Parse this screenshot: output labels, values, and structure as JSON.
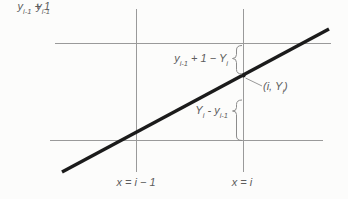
{
  "figure": {
    "background": "#fcfcfb",
    "colors": {
      "guide_line": "#9a9a9a",
      "main_line": "#1b1b1b",
      "annotation": "#8c8c8c",
      "text": "#5d5d5d"
    },
    "labels": {
      "y_top": {
        "p1": "y",
        "s1": "i-1",
        "p2": " + 1"
      },
      "y_bottom": {
        "p1": "y",
        "s1": "i-1"
      },
      "gap_upper": {
        "p1": "y",
        "s1": "i-1",
        "p2": " + 1 − ",
        "p3": "Y",
        "s3": "i"
      },
      "gap_lower": {
        "p1": "Y",
        "s1": "i",
        "p2": " - ",
        "p3": "y",
        "s3": "i-1"
      },
      "point": {
        "p1": "(i, ",
        "p2": "Y",
        "s2": "i",
        "p3": ")"
      },
      "x_left": "x = i − 1",
      "x_right": "x = i"
    }
  }
}
